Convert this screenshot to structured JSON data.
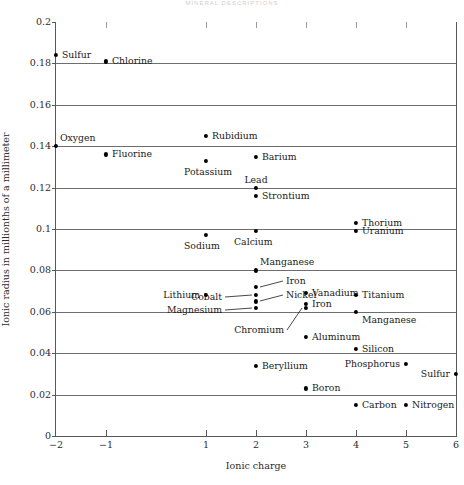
{
  "page": {
    "running_header": "MINERAL DESCRIPTIONS"
  },
  "chart_data": {
    "type": "scatter",
    "title": "",
    "xlabel": "Ionic charge",
    "ylabel": "Ionic radius in millionths of a millimeter",
    "xlim": [
      -2,
      6
    ],
    "ylim": [
      0,
      0.2
    ],
    "grid": "horizontal",
    "legend": "none",
    "marker": "filled-circle",
    "marker_color": "#000000",
    "xticks": [
      -2,
      -1,
      1,
      2,
      3,
      4,
      5,
      6
    ],
    "xtick_labels": [
      "−2",
      "−1",
      "1",
      "2",
      "3",
      "4",
      "5",
      "6"
    ],
    "yticks": [
      0,
      0.02,
      0.04,
      0.06,
      0.08,
      0.1,
      0.12,
      0.14,
      0.16,
      0.18,
      0.2
    ],
    "ytick_labels": [
      "0",
      "0.02",
      "0.04",
      "0.06",
      "0.08",
      "0.1",
      "0.12",
      "0.14",
      "0.16",
      "0.18",
      "0.2"
    ],
    "points": [
      {
        "label": "Sulfur",
        "x": -2,
        "y": 0.184,
        "label_pos": "right"
      },
      {
        "label": "Chlorine",
        "x": -1,
        "y": 0.181,
        "label_pos": "right"
      },
      {
        "label": "Oxygen",
        "x": -2,
        "y": 0.14,
        "label_pos": "above-right"
      },
      {
        "label": "Fluorine",
        "x": -1,
        "y": 0.136,
        "label_pos": "right"
      },
      {
        "label": "Rubidium",
        "x": 1,
        "y": 0.145,
        "label_pos": "right"
      },
      {
        "label": "Potassium",
        "x": 1,
        "y": 0.133,
        "label_pos": "below"
      },
      {
        "label": "Barium",
        "x": 2,
        "y": 0.135,
        "label_pos": "right"
      },
      {
        "label": "Lead",
        "x": 2,
        "y": 0.12,
        "label_pos": "above"
      },
      {
        "label": "Strontium",
        "x": 2,
        "y": 0.116,
        "label_pos": "right"
      },
      {
        "label": "Thorium",
        "x": 4,
        "y": 0.103,
        "label_pos": "right"
      },
      {
        "label": "Uranium",
        "x": 4,
        "y": 0.099,
        "label_pos": "right"
      },
      {
        "label": "Sodium",
        "x": 1,
        "y": 0.097,
        "label_pos": "below"
      },
      {
        "label": "Calcium",
        "x": 2,
        "y": 0.099,
        "label_pos": "below"
      },
      {
        "label": "Manganese",
        "x": 2,
        "y": 0.08,
        "label_pos": "above-right"
      },
      {
        "label": "Iron",
        "x": 2,
        "y": 0.072,
        "label_pos": "leader-right"
      },
      {
        "label": "Cobalt",
        "x": 2,
        "y": 0.068,
        "label_pos": "leader-left"
      },
      {
        "label": "Nickel",
        "x": 2,
        "y": 0.065,
        "label_pos": "leader-right"
      },
      {
        "label": "Magnesium",
        "x": 2,
        "y": 0.062,
        "label_pos": "leader-left"
      },
      {
        "label": "Lithium",
        "x": 1,
        "y": 0.068,
        "label_pos": "left"
      },
      {
        "label": "Vanadium",
        "x": 3,
        "y": 0.069,
        "label_pos": "right"
      },
      {
        "label": "Titanium",
        "x": 4,
        "y": 0.068,
        "label_pos": "right"
      },
      {
        "label": "Iron",
        "x": 3,
        "y": 0.064,
        "label_pos": "right"
      },
      {
        "label": "Chromium",
        "x": 3,
        "y": 0.062,
        "label_pos": "leader-left"
      },
      {
        "label": "Manganese",
        "x": 4,
        "y": 0.06,
        "label_pos": "below-right"
      },
      {
        "label": "Aluminum",
        "x": 3,
        "y": 0.048,
        "label_pos": "right"
      },
      {
        "label": "Silicon",
        "x": 4,
        "y": 0.042,
        "label_pos": "right"
      },
      {
        "label": "Beryllium",
        "x": 2,
        "y": 0.034,
        "label_pos": "right"
      },
      {
        "label": "Phosphorus",
        "x": 5,
        "y": 0.035,
        "label_pos": "left"
      },
      {
        "label": "Sulfur",
        "x": 6,
        "y": 0.03,
        "label_pos": "left"
      },
      {
        "label": "Boron",
        "x": 3,
        "y": 0.023,
        "label_pos": "right"
      },
      {
        "label": "Carbon",
        "x": 4,
        "y": 0.015,
        "label_pos": "right"
      },
      {
        "label": "Nitrogen",
        "x": 5,
        "y": 0.015,
        "label_pos": "right"
      }
    ]
  }
}
